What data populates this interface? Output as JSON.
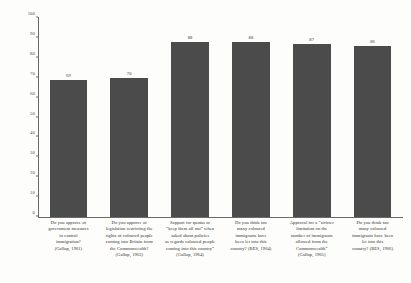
{
  "chart_data": {
    "type": "bar",
    "title": "",
    "subtitle": "",
    "xlabel": "",
    "ylabel": "",
    "ylim": [
      0,
      100
    ],
    "yticks": [
      0,
      10,
      20,
      30,
      40,
      50,
      60,
      70,
      80,
      90,
      100
    ],
    "grid": false,
    "legend": "none",
    "bar_color": "#4b4b4b",
    "value_labels": true,
    "categories": [
      "Do you approve of government measures to control immigration? (Gallup, 1961)",
      "Do you approve of legislation restricting the rights of coloured people coming into Britain from the Commonwealth? (Gallup, 1963)",
      "Support for quotas or “keep them all out” when asked about policies as regards coloured people coming into this country” (Gallup, 1964)",
      "Do you think too many coloured immigrants have been let into this country? (BES, 1964)",
      "Approval for a “stricter limitation on the number of immigrants allowed from the Commonwealth” (Gallup, 1965)",
      "Do you think too many coloured immigrants have been let into this country? (BES, 1966)"
    ],
    "values": [
      69,
      70,
      88,
      88,
      87,
      86
    ]
  },
  "axis": {
    "tick_labels": [
      "0",
      "10",
      "20",
      "30",
      "40",
      "50",
      "60",
      "70",
      "80",
      "90",
      "100"
    ]
  },
  "bars": [
    {
      "value_label": "69",
      "lines": [
        "Do you approve of",
        "government measures",
        "to control",
        "immigration?",
        "(Gallup, 1961)"
      ]
    },
    {
      "value_label": "70",
      "lines": [
        "Do you approve of",
        "legislation restricting the",
        "rights of coloured people",
        "coming into Britain from",
        "the Commonwealth?",
        "(Gallup, 1963)"
      ]
    },
    {
      "value_label": "88",
      "lines": [
        "Support for quotas or",
        "“keep them all out” when",
        "asked about policies",
        "as regards coloured people",
        "coming into this country”",
        "(Gallup, 1964)"
      ]
    },
    {
      "value_label": "88",
      "lines": [
        "Do you think too",
        "many coloured",
        "immigrants have",
        "been let into this",
        "country? (BES, 1964)"
      ]
    },
    {
      "value_label": "87",
      "lines": [
        "Approval for a “stricter",
        "limitation on the",
        "number of immigrants",
        "allowed from the",
        "Commonwealth”",
        "(Gallup, 1965)"
      ]
    },
    {
      "value_label": "86",
      "lines": [
        "Do you think too",
        "many coloured",
        "immigrants have been",
        "let into this",
        "country? (BES, 1966)"
      ]
    }
  ]
}
